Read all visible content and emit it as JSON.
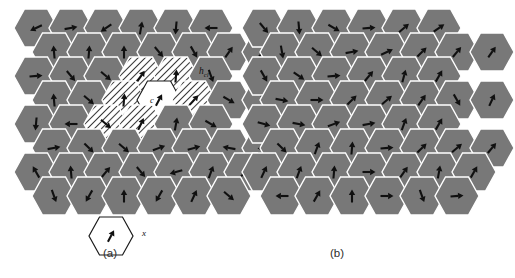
{
  "figure": {
    "type": "hexagonal-cell-spin-diagram",
    "colors": {
      "cell_gray": "#787878",
      "cell_white": "#ffffff",
      "outline": "#ffffff",
      "arrow": "#101010",
      "background": "#ffffff"
    },
    "geometry": {
      "hex_orientation": "flat-top",
      "rows": 8,
      "cells_per_row": [
        6,
        7,
        6,
        7,
        6,
        7,
        7,
        6
      ]
    }
  },
  "panels": [
    {
      "id": "a",
      "label": "(a)",
      "cluster": {
        "center_label": "c",
        "center_fill": "white",
        "ring_fill": "hatched",
        "ring_count": 6
      },
      "annotations": {
        "hcl_base": "h",
        "hcl_sub": "cl"
      },
      "legend": {
        "cell_label": "x",
        "cell_fill": "white"
      },
      "arrows": [
        {
          "row": 0,
          "col": 0,
          "angle": 205
        },
        {
          "row": 0,
          "col": 1,
          "angle": 10
        },
        {
          "row": 0,
          "col": 2,
          "angle": 215
        },
        {
          "row": 0,
          "col": 3,
          "angle": 80
        },
        {
          "row": 0,
          "col": 4,
          "angle": 265
        },
        {
          "row": 0,
          "col": 5,
          "angle": 180
        },
        {
          "row": 1,
          "col": 0,
          "angle": 95
        },
        {
          "row": 1,
          "col": 1,
          "angle": 85
        },
        {
          "row": 1,
          "col": 2,
          "angle": 90
        },
        {
          "row": 1,
          "col": 3,
          "angle": 310
        },
        {
          "row": 1,
          "col": 4,
          "angle": 300
        },
        {
          "row": 1,
          "col": 5,
          "angle": 55
        },
        {
          "row": 1,
          "col": 6,
          "angle": 40
        },
        {
          "row": 2,
          "col": 0,
          "angle": 5
        },
        {
          "row": 2,
          "col": 1,
          "angle": 310
        },
        {
          "row": 2,
          "col": 2,
          "angle": 320
        },
        {
          "row": 2,
          "col": 3,
          "angle": 55
        },
        {
          "row": 2,
          "col": 4,
          "angle": 85
        },
        {
          "row": 2,
          "col": 5,
          "angle": 290
        },
        {
          "row": 2,
          "col": 6,
          "angle": 250
        },
        {
          "row": 3,
          "col": 0,
          "angle": 95
        },
        {
          "row": 3,
          "col": 1,
          "angle": 320
        },
        {
          "row": 3,
          "col": 2,
          "angle": 85
        },
        {
          "row": 3,
          "col": 3,
          "angle": 62
        },
        {
          "row": 3,
          "col": 4,
          "angle": 48
        },
        {
          "row": 3,
          "col": 5,
          "angle": 330
        },
        {
          "row": 3,
          "col": 6,
          "angle": 300
        },
        {
          "row": 4,
          "col": 0,
          "angle": 265
        },
        {
          "row": 4,
          "col": 1,
          "angle": 180
        },
        {
          "row": 4,
          "col": 2,
          "angle": 320
        },
        {
          "row": 4,
          "col": 3,
          "angle": 65
        },
        {
          "row": 4,
          "col": 4,
          "angle": 80
        },
        {
          "row": 4,
          "col": 5,
          "angle": 330
        },
        {
          "row": 5,
          "col": 0,
          "angle": 10
        },
        {
          "row": 5,
          "col": 1,
          "angle": 315
        },
        {
          "row": 5,
          "col": 2,
          "angle": 320
        },
        {
          "row": 5,
          "col": 3,
          "angle": 20
        },
        {
          "row": 5,
          "col": 4,
          "angle": 15
        },
        {
          "row": 5,
          "col": 5,
          "angle": 170
        },
        {
          "row": 5,
          "col": 6,
          "angle": 185
        },
        {
          "row": 6,
          "col": 0,
          "angle": 120
        },
        {
          "row": 6,
          "col": 1,
          "angle": 95
        },
        {
          "row": 6,
          "col": 2,
          "angle": 50
        },
        {
          "row": 6,
          "col": 3,
          "angle": 310
        },
        {
          "row": 6,
          "col": 4,
          "angle": 195
        },
        {
          "row": 6,
          "col": 5,
          "angle": 70
        },
        {
          "row": 6,
          "col": 6,
          "angle": 40
        },
        {
          "row": 7,
          "col": 0,
          "angle": 290
        },
        {
          "row": 7,
          "col": 1,
          "angle": 240
        },
        {
          "row": 7,
          "col": 2,
          "angle": 90
        },
        {
          "row": 7,
          "col": 3,
          "angle": 240
        },
        {
          "row": 7,
          "col": 4,
          "angle": 65
        },
        {
          "row": 7,
          "col": 5,
          "angle": 320
        }
      ],
      "legend_arrow_angle": 62,
      "cluster_arrows": {
        "center": 62,
        "ring": [
          70,
          85,
          95,
          55,
          80,
          70
        ]
      }
    },
    {
      "id": "b",
      "label": "(b)",
      "arrows": [
        {
          "row": 0,
          "col": 0,
          "angle": 310
        },
        {
          "row": 0,
          "col": 1,
          "angle": 275
        },
        {
          "row": 0,
          "col": 2,
          "angle": 330
        },
        {
          "row": 0,
          "col": 3,
          "angle": 5
        },
        {
          "row": 0,
          "col": 4,
          "angle": 40
        },
        {
          "row": 0,
          "col": 5,
          "angle": 35
        },
        {
          "row": 1,
          "col": 0,
          "angle": 280
        },
        {
          "row": 1,
          "col": 1,
          "angle": 320
        },
        {
          "row": 1,
          "col": 2,
          "angle": 10
        },
        {
          "row": 1,
          "col": 3,
          "angle": 25
        },
        {
          "row": 1,
          "col": 4,
          "angle": 45
        },
        {
          "row": 1,
          "col": 5,
          "angle": 50
        },
        {
          "row": 1,
          "col": 6,
          "angle": 55
        },
        {
          "row": 2,
          "col": 0,
          "angle": 300
        },
        {
          "row": 2,
          "col": 1,
          "angle": 325
        },
        {
          "row": 2,
          "col": 2,
          "angle": 5
        },
        {
          "row": 2,
          "col": 3,
          "angle": 50
        },
        {
          "row": 2,
          "col": 4,
          "angle": 75
        },
        {
          "row": 2,
          "col": 5,
          "angle": 60
        },
        {
          "row": 2,
          "col": 6,
          "angle": 55
        },
        {
          "row": 3,
          "col": 0,
          "angle": 350
        },
        {
          "row": 3,
          "col": 1,
          "angle": 0
        },
        {
          "row": 3,
          "col": 2,
          "angle": 45
        },
        {
          "row": 3,
          "col": 3,
          "angle": 40
        },
        {
          "row": 3,
          "col": 4,
          "angle": 55
        },
        {
          "row": 3,
          "col": 5,
          "angle": 300
        },
        {
          "row": 3,
          "col": 6,
          "angle": 65
        },
        {
          "row": 4,
          "col": 0,
          "angle": 345
        },
        {
          "row": 4,
          "col": 1,
          "angle": 350
        },
        {
          "row": 4,
          "col": 2,
          "angle": 20
        },
        {
          "row": 4,
          "col": 3,
          "angle": 10
        },
        {
          "row": 4,
          "col": 4,
          "angle": 70
        },
        {
          "row": 4,
          "col": 5,
          "angle": 60
        },
        {
          "row": 5,
          "col": 0,
          "angle": 315
        },
        {
          "row": 5,
          "col": 1,
          "angle": 70
        },
        {
          "row": 5,
          "col": 2,
          "angle": 85
        },
        {
          "row": 5,
          "col": 3,
          "angle": 5
        },
        {
          "row": 5,
          "col": 4,
          "angle": 45
        },
        {
          "row": 5,
          "col": 5,
          "angle": 40
        },
        {
          "row": 5,
          "col": 6,
          "angle": 50
        },
        {
          "row": 6,
          "col": 0,
          "angle": 65
        },
        {
          "row": 6,
          "col": 1,
          "angle": 70
        },
        {
          "row": 6,
          "col": 2,
          "angle": 85
        },
        {
          "row": 6,
          "col": 3,
          "angle": 0
        },
        {
          "row": 6,
          "col": 4,
          "angle": 55
        },
        {
          "row": 6,
          "col": 5,
          "angle": 80
        },
        {
          "row": 6,
          "col": 6,
          "angle": 60
        },
        {
          "row": 7,
          "col": 0,
          "angle": 180
        },
        {
          "row": 7,
          "col": 1,
          "angle": 60
        },
        {
          "row": 7,
          "col": 2,
          "angle": 90
        },
        {
          "row": 7,
          "col": 3,
          "angle": 0
        },
        {
          "row": 7,
          "col": 4,
          "angle": 290
        },
        {
          "row": 7,
          "col": 5,
          "angle": 5
        }
      ]
    }
  ]
}
